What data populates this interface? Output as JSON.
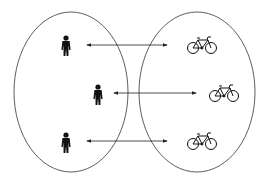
{
  "diagram": {
    "type": "one-to-one mapping",
    "left_set": {
      "label": "people",
      "count": 3
    },
    "right_set": {
      "label": "bicycles",
      "count": 3
    },
    "mappings": [
      {
        "from": "person-1",
        "to": "bicycle-1",
        "style": "double-arrow"
      },
      {
        "from": "person-2",
        "to": "bicycle-2",
        "style": "double-arrow"
      },
      {
        "from": "person-3",
        "to": "bicycle-3",
        "style": "double-arrow"
      }
    ],
    "colors": {
      "stroke": "#333333",
      "fill": "#000000",
      "background": "#ffffff"
    }
  }
}
